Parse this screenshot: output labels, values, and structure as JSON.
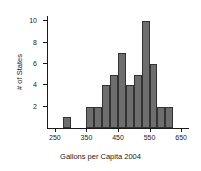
{
  "chart_data": {
    "type": "bar",
    "title": "",
    "xlabel": "Gallons per Capita 2004",
    "ylabel": "# of States",
    "xlim": [
      225,
      675
    ],
    "ylim": [
      0,
      10.5
    ],
    "xticks": [
      250,
      350,
      450,
      550,
      650
    ],
    "yticks": [
      2,
      4,
      6,
      8,
      10
    ],
    "xtick_labels": [
      "250",
      "350",
      "450",
      "550",
      "650"
    ],
    "ytick_labels": [
      "2",
      "4",
      "6",
      "8",
      "10"
    ],
    "grid": false,
    "legend": false,
    "bin_width": 25,
    "bar_color": "#6e6e6e",
    "bar_edge_color": "#333333",
    "bins": [
      {
        "start": 275,
        "end": 300,
        "count": 1
      },
      {
        "start": 350,
        "end": 375,
        "count": 2
      },
      {
        "start": 375,
        "end": 400,
        "count": 2
      },
      {
        "start": 400,
        "end": 425,
        "count": 4
      },
      {
        "start": 425,
        "end": 450,
        "count": 5
      },
      {
        "start": 450,
        "end": 475,
        "count": 7
      },
      {
        "start": 475,
        "end": 500,
        "count": 4
      },
      {
        "start": 500,
        "end": 525,
        "count": 5
      },
      {
        "start": 525,
        "end": 550,
        "count": 10
      },
      {
        "start": 550,
        "end": 575,
        "count": 6
      },
      {
        "start": 575,
        "end": 600,
        "count": 2
      },
      {
        "start": 600,
        "end": 625,
        "count": 2
      }
    ],
    "categories": [
      "275-300",
      "350-375",
      "375-400",
      "400-425",
      "425-450",
      "450-475",
      "475-500",
      "500-525",
      "525-550",
      "550-575",
      "575-600",
      "600-625"
    ],
    "values": [
      1,
      2,
      2,
      4,
      5,
      7,
      4,
      5,
      10,
      6,
      2,
      2
    ]
  }
}
